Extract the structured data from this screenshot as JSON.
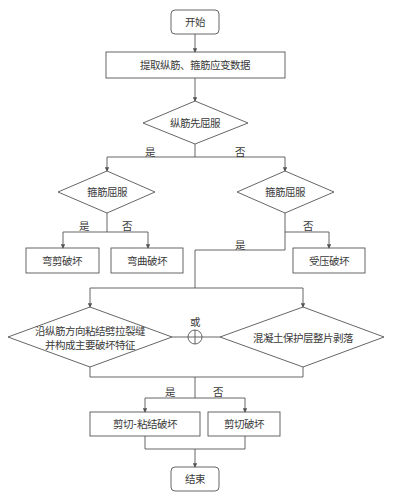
{
  "diagram": {
    "type": "flowchart",
    "stroke_color": "#555555",
    "nodes": {
      "start": {
        "label": "开始",
        "shape": "rounded-rect"
      },
      "extract": {
        "label": "提取纵筋、箍筋应变数据",
        "shape": "rect"
      },
      "d_long_yield": {
        "label": "纵筋先屈服",
        "shape": "diamond"
      },
      "d_stirrup_yield_left": {
        "label": "箍筋屈服",
        "shape": "diamond"
      },
      "d_stirrup_yield_right": {
        "label": "箍筋屈服",
        "shape": "diamond"
      },
      "flex_shear": {
        "label": "弯剪破坏",
        "shape": "rect"
      },
      "flexure": {
        "label": "弯曲破坏",
        "shape": "rect"
      },
      "compression": {
        "label": "受压破坏",
        "shape": "rect"
      },
      "d_bond_crack": {
        "line1": "沿纵筋方向粘结劈拉裂缝",
        "line2": "并构成主要破坏特征",
        "shape": "diamond"
      },
      "or_junction": {
        "label": "或",
        "shape": "circle-plus"
      },
      "d_cover_spall": {
        "label": "混凝土保护层整片剥落",
        "shape": "diamond"
      },
      "shear_bond": {
        "label": "剪切-粘结破坏",
        "shape": "rect"
      },
      "shear": {
        "label": "剪切破坏",
        "shape": "rect"
      },
      "end": {
        "label": "结束",
        "shape": "rounded-rect"
      }
    },
    "edge_labels": {
      "long_yes": "是",
      "long_no": "否",
      "stirrup_left_yes": "是",
      "stirrup_left_no": "否",
      "stirrup_right_yes": "是",
      "stirrup_right_no": "否",
      "bond_yes": "是",
      "bond_no": "否"
    },
    "edges": [
      {
        "from": "start",
        "to": "extract"
      },
      {
        "from": "extract",
        "to": "d_long_yield"
      },
      {
        "from": "d_long_yield",
        "to": "d_stirrup_yield_left",
        "label": "是"
      },
      {
        "from": "d_long_yield",
        "to": "d_stirrup_yield_right",
        "label": "否"
      },
      {
        "from": "d_stirrup_yield_left",
        "to": "flex_shear",
        "label": "是"
      },
      {
        "from": "d_stirrup_yield_left",
        "to": "flexure",
        "label": "否"
      },
      {
        "from": "d_stirrup_yield_right",
        "to": "compression",
        "label": "否"
      },
      {
        "from": "d_stirrup_yield_right",
        "to": "d_bond_crack",
        "label": "是"
      },
      {
        "from": "d_stirrup_yield_right",
        "to": "d_cover_spall",
        "label": "是"
      },
      {
        "from": "or_junction",
        "to": "shear_bond",
        "label": "是"
      },
      {
        "from": "or_junction",
        "to": "shear",
        "label": "否"
      },
      {
        "from": "shear_bond",
        "to": "end"
      },
      {
        "from": "shear",
        "to": "end"
      }
    ]
  }
}
